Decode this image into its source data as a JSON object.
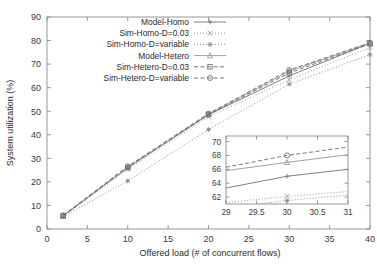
{
  "chart_data": {
    "type": "line",
    "title": "",
    "xlabel": "Offered load (# of concurrent flows)",
    "ylabel": "System utilization (%)",
    "xlim": [
      0,
      40
    ],
    "ylim": [
      0,
      90
    ],
    "xticks": [
      "0",
      "5",
      "10",
      "15",
      "20",
      "25",
      "30",
      "35",
      "40"
    ],
    "xtick_values": [
      0,
      5,
      10,
      15,
      20,
      25,
      30,
      35,
      40
    ],
    "yticks": [
      "0",
      "10",
      "20",
      "30",
      "40",
      "50",
      "60",
      "70",
      "80",
      "90"
    ],
    "ytick_values": [
      0,
      10,
      20,
      30,
      40,
      50,
      60,
      70,
      80,
      90
    ],
    "grid": false,
    "legend_position": "top-center",
    "x": [
      2,
      10,
      20,
      30,
      40
    ],
    "series": [
      {
        "name": "Model-Homo",
        "marker": "plus",
        "dash": "solid",
        "color": "#7a7a7a",
        "values": [
          5.6,
          26.0,
          48.5,
          65.0,
          78.8
        ]
      },
      {
        "name": "Sim-Homo-D=0.03",
        "marker": "cross",
        "dash": "dotted",
        "color": "#9a9a9a",
        "values": [
          5.4,
          25.3,
          47.6,
          63.4,
          77.0
        ]
      },
      {
        "name": "Sim-Homo-D=variable",
        "marker": "star",
        "dash": "dotted",
        "color": "#8a8a8a",
        "values": [
          5.2,
          20.4,
          42.2,
          61.5,
          74.0
        ]
      },
      {
        "name": "Model-Hetero",
        "marker": "triangle",
        "dash": "solid",
        "color": "#9c9c9c",
        "values": [
          5.7,
          26.2,
          48.7,
          67.0,
          78.9
        ]
      },
      {
        "name": "Sim-Hetero-D=0.03",
        "marker": "square",
        "dash": "dashed",
        "color": "#707070",
        "values": [
          5.5,
          26.1,
          48.6,
          66.2,
          78.6
        ]
      },
      {
        "name": "Sim-Hetero-D=variable",
        "marker": "circle",
        "dash": "dashed",
        "color": "#6f6f6f",
        "values": [
          5.8,
          26.6,
          49.0,
          67.5,
          79.1
        ]
      }
    ],
    "inset": {
      "xlim": [
        29,
        31
      ],
      "ylim": [
        61,
        70.8
      ],
      "xticks": [
        "29",
        "29.5",
        "30",
        "30.5",
        "31"
      ],
      "xtick_values": [
        29,
        29.5,
        30,
        30.5,
        31
      ],
      "yticks": [
        "62",
        "64",
        "66",
        "68",
        "70"
      ],
      "ytick_values": [
        62,
        64,
        66,
        68,
        70
      ],
      "x": [
        29,
        30,
        31
      ],
      "series": [
        {
          "name": "Model-Homo",
          "marker": "plus",
          "dash": "solid",
          "color": "#7a7a7a",
          "values": [
            63.3,
            65.0,
            66.0
          ]
        },
        {
          "name": "Sim-Homo-D=0.03",
          "marker": "cross",
          "dash": "dotted",
          "color": "#9a9a9a",
          "values": [
            61.2,
            62.1,
            62.8
          ]
        },
        {
          "name": "Sim-Homo-D=variable",
          "marker": "star",
          "dash": "dotted",
          "color": "#8a8a8a",
          "values": [
            60.4,
            61.5,
            62.3
          ]
        },
        {
          "name": "Model-Hetero",
          "marker": "triangle",
          "dash": "solid",
          "color": "#9c9c9c",
          "values": [
            65.8,
            67.0,
            68.1
          ]
        },
        {
          "name": "Sim-Hetero-D=variable",
          "marker": "circle",
          "dash": "dashed",
          "color": "#6f6f6f",
          "values": [
            66.3,
            68.0,
            69.2
          ]
        }
      ]
    }
  },
  "legend": {
    "items": [
      {
        "label": "Model-Homo"
      },
      {
        "label": "Sim-Homo-D=0.03"
      },
      {
        "label": "Sim-Homo-D=variable"
      },
      {
        "label": "Model-Hetero"
      },
      {
        "label": "Sim-Hetero-D=0.03"
      },
      {
        "label": "Sim-Hetero-D=variable"
      }
    ]
  }
}
